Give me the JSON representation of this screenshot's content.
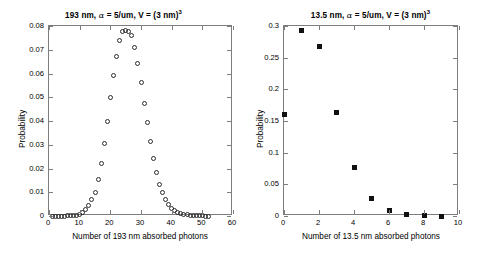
{
  "figure": {
    "background": "#ffffff",
    "marker_color": "#111111",
    "axis_color": "#7d7d7d"
  },
  "chart_data": [
    {
      "type": "scatter",
      "id": "left",
      "title": "193 nm, α = 5/um, V = (3 nm)",
      "title_sup": "3",
      "title_prefix": "193 nm, ",
      "title_alpha": "α",
      "title_mid": " = 5/um, V = (3 nm)",
      "xlabel": "Number of 193 nm absorbed photons",
      "ylabel": "Probability",
      "marker": "open-circle",
      "xlim": [
        0,
        60
      ],
      "ylim": [
        0,
        0.08
      ],
      "xticks": [
        0,
        10,
        20,
        30,
        40,
        50,
        60
      ],
      "xticklabels": [
        "0",
        "10",
        "20",
        "30",
        "40",
        "50",
        "60"
      ],
      "yticks": [
        0,
        0.01,
        0.02,
        0.03,
        0.04,
        0.05,
        0.06,
        0.07,
        0.08
      ],
      "yticklabels": [
        "0",
        "0.01",
        "0.02",
        "0.03",
        "0.04",
        "0.05",
        "0.06",
        "0.07",
        "0.08"
      ],
      "grid": false,
      "legend": "none",
      "x": [
        1,
        2,
        3,
        4,
        5,
        6,
        7,
        8,
        9,
        10,
        11,
        12,
        13,
        14,
        15,
        16,
        17,
        18,
        19,
        20,
        21,
        22,
        23,
        24,
        25,
        26,
        27,
        28,
        29,
        30,
        31,
        32,
        33,
        34,
        35,
        36,
        37,
        38,
        39,
        40,
        41,
        42,
        43,
        44,
        45,
        46,
        47,
        48,
        49,
        50,
        51,
        52
      ],
      "values": [
        0.0,
        0.0,
        0.0,
        0.0,
        0.0,
        0.0001,
        0.0001,
        0.0002,
        0.0004,
        0.0008,
        0.0016,
        0.0028,
        0.0046,
        0.007,
        0.01,
        0.0152,
        0.022,
        0.0305,
        0.0398,
        0.0497,
        0.0592,
        0.0673,
        0.0737,
        0.0775,
        0.0779,
        0.0776,
        0.076,
        0.071,
        0.0643,
        0.0561,
        0.0474,
        0.0392,
        0.0312,
        0.0243,
        0.0182,
        0.0134,
        0.0097,
        0.0068,
        0.0047,
        0.0032,
        0.0022,
        0.0015,
        0.001,
        0.0007,
        0.0005,
        0.0003,
        0.0002,
        0.0001,
        0.0001,
        0.0001,
        0.0,
        0.0
      ]
    },
    {
      "type": "scatter",
      "id": "right",
      "title": "13.5 nm, α = 5/um, V = (3 nm)",
      "title_sup": "3",
      "title_prefix": "13.5 nm, ",
      "title_alpha": "α",
      "title_mid": " = 5/um, V = (3 nm)",
      "xlabel": "Number of 13.5 nm absorbed photons",
      "ylabel": "Probability",
      "marker": "filled-square",
      "xlim": [
        0,
        10
      ],
      "ylim": [
        0,
        0.3
      ],
      "xticks": [
        0,
        2,
        4,
        6,
        8,
        10
      ],
      "xticklabels": [
        "0",
        "2",
        "4",
        "6",
        "8",
        "10"
      ],
      "yticks": [
        0,
        0.05,
        0.1,
        0.15,
        0.2,
        0.25,
        0.3
      ],
      "yticklabels": [
        "0",
        "0.05",
        "0.1",
        "0.15",
        "0.2",
        "0.25",
        "0.3"
      ],
      "grid": false,
      "legend": "none",
      "x": [
        0,
        1,
        2,
        3,
        4,
        5,
        6,
        7,
        8,
        9
      ],
      "values": [
        0.16,
        0.293,
        0.268,
        0.163,
        0.076,
        0.028,
        0.008,
        0.002,
        0.001,
        0.0
      ]
    }
  ]
}
